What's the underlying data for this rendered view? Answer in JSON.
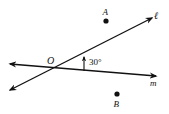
{
  "diagram": {
    "colors": {
      "ink": "#111111",
      "background": "#ffffff"
    },
    "lines": [
      {
        "id": "l",
        "label": "ℓ",
        "from": [
          10,
          90
        ],
        "to": [
          152,
          18
        ]
      },
      {
        "id": "m",
        "label": "m",
        "from": [
          10,
          64
        ],
        "to": [
          156,
          76
        ]
      }
    ],
    "intersection": {
      "label": "O",
      "at": [
        53,
        68
      ]
    },
    "points": [
      {
        "id": "A",
        "label": "A",
        "at": [
          106,
          21
        ]
      },
      {
        "id": "B",
        "label": "B",
        "at": [
          117,
          94
        ]
      }
    ],
    "angle": {
      "value_label": "30°",
      "between": [
        "m",
        "l"
      ]
    }
  }
}
